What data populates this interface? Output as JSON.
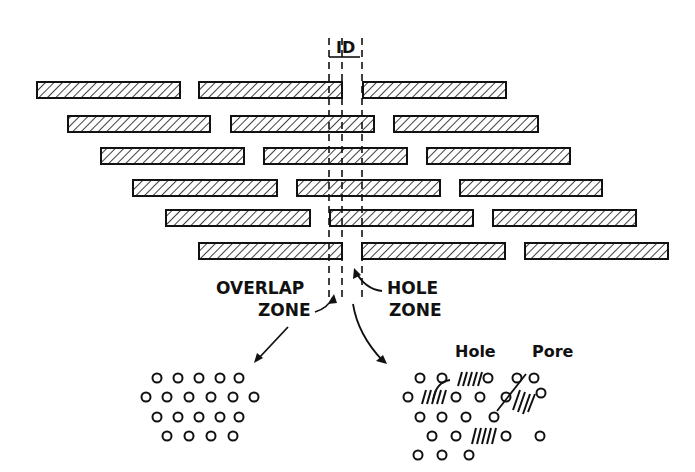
{
  "figure": {
    "top_label": "ID",
    "overlap_label_line1": "OVERLAP",
    "overlap_label_line2": "ZONE",
    "hole_label_line1": "HOLE",
    "hole_label_line2": "ZONE",
    "hole_callout": "Hole",
    "pore_callout": "Pore"
  },
  "colors": {
    "ink": "#111111",
    "background": "#ffffff"
  },
  "rows": [
    {
      "y": 82,
      "bars": [
        [
          37,
          180
        ],
        [
          199,
          342
        ],
        [
          363,
          506
        ]
      ]
    },
    {
      "y": 116,
      "bars": [
        [
          68,
          210
        ],
        [
          231,
          374
        ],
        [
          394,
          538
        ]
      ]
    },
    {
      "y": 148,
      "bars": [
        [
          101,
          244
        ],
        [
          264,
          407
        ],
        [
          427,
          570
        ]
      ]
    },
    {
      "y": 180,
      "bars": [
        [
          133,
          277
        ],
        [
          297,
          440
        ],
        [
          460,
          602
        ]
      ]
    },
    {
      "y": 210,
      "bars": [
        [
          166,
          310
        ],
        [
          330,
          473
        ],
        [
          493,
          636
        ]
      ]
    },
    {
      "y": 243,
      "bars": [
        [
          199,
          342
        ],
        [
          362,
          505
        ],
        [
          525,
          668
        ]
      ]
    }
  ],
  "dashed_lines_x": [
    329,
    342,
    362
  ]
}
